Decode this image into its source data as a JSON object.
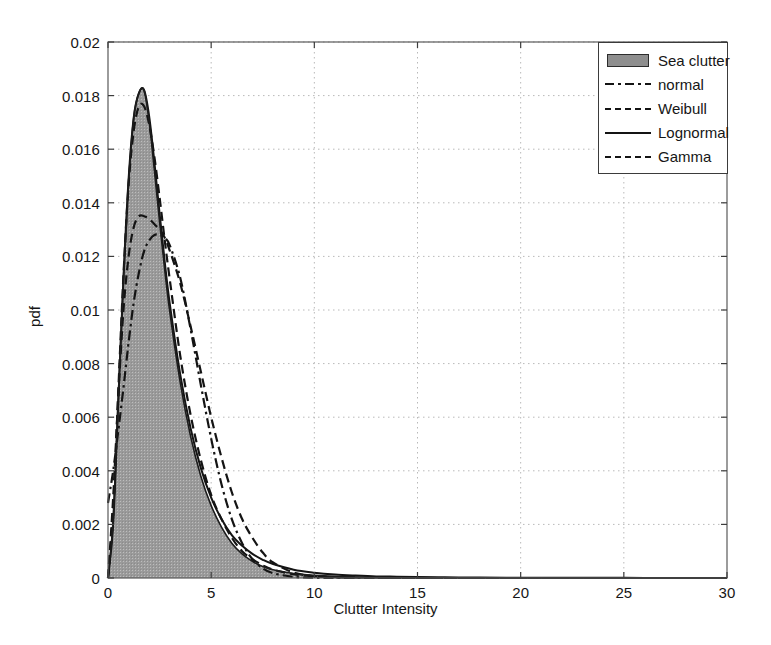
{
  "chart_data": {
    "type": "line",
    "title": "",
    "xlabel": "Clutter Intensity",
    "ylabel": "pdf",
    "xlim": [
      0,
      30
    ],
    "ylim": [
      0,
      0.02
    ],
    "xticks": [
      "0",
      "5",
      "10",
      "15",
      "20",
      "25",
      "30"
    ],
    "xtick_values": [
      0,
      5,
      10,
      15,
      20,
      25,
      30
    ],
    "yticks": [
      "0",
      "0.002",
      "0.004",
      "0.006",
      "0.008",
      "0.01",
      "0.012",
      "0.014",
      "0.016",
      "0.018",
      "0.02"
    ],
    "ytick_values": [
      0,
      0.002,
      0.004,
      0.006,
      0.008,
      0.01,
      0.012,
      0.014,
      0.016,
      0.018,
      0.02
    ],
    "grid": true,
    "legend_position": "top-right",
    "legend_entries": [
      {
        "label": "Sea clutter",
        "style": "patch",
        "color": "#8e8e8e"
      },
      {
        "label": "normal",
        "style": "dashdot",
        "color": "#141414"
      },
      {
        "label": "Weibull",
        "style": "dashed",
        "color": "#141414"
      },
      {
        "label": "Lognormal",
        "style": "solid",
        "color": "#141414"
      },
      {
        "label": "Gamma",
        "style": "dashed",
        "color": "#141414"
      }
    ],
    "x": [
      0,
      0.25,
      0.5,
      0.75,
      1,
      1.25,
      1.5,
      1.75,
      2,
      2.25,
      2.5,
      2.75,
      3,
      3.5,
      4,
      4.5,
      5,
      5.5,
      6,
      6.5,
      7,
      7.5,
      8,
      9,
      10,
      11,
      12,
      13,
      14,
      15,
      16,
      17,
      18,
      20,
      22,
      24,
      26,
      28,
      30
    ],
    "series": [
      {
        "name": "Sea clutter",
        "style": "filled-area",
        "values": [
          0.0,
          0.0022,
          0.0068,
          0.0112,
          0.0148,
          0.0172,
          0.0181,
          0.0182,
          0.017,
          0.0152,
          0.0133,
          0.0115,
          0.0099,
          0.0073,
          0.0053,
          0.0038,
          0.0027,
          0.0019,
          0.0013,
          0.0009,
          0.00062,
          0.00043,
          0.00031,
          0.00017,
          0.0001,
          6e-05,
          4e-05,
          3e-05,
          2e-05,
          2e-05,
          1e-05,
          1e-05,
          1e-05,
          1e-05,
          0.0,
          0.0,
          0.0,
          0.0,
          0.0
        ]
      },
      {
        "name": "normal",
        "style": "dashdot",
        "values": [
          0.0028,
          0.004,
          0.0055,
          0.0071,
          0.0088,
          0.0103,
          0.0114,
          0.0122,
          0.0126,
          0.0128,
          0.0128,
          0.0127,
          0.0124,
          0.0112,
          0.0093,
          0.0072,
          0.0052,
          0.0035,
          0.0022,
          0.0013,
          0.0007,
          0.00036,
          0.00018,
          4e-05,
          1e-05,
          0.0,
          0.0,
          0.0,
          0.0,
          0.0,
          0.0,
          0.0,
          0.0,
          0.0,
          0.0,
          0.0,
          0.0,
          0.0,
          0.0
        ]
      },
      {
        "name": "Weibull",
        "style": "dashed",
        "values": [
          0.0,
          0.003,
          0.0068,
          0.01,
          0.012,
          0.0131,
          0.0135,
          0.0135,
          0.0134,
          0.0132,
          0.013,
          0.0127,
          0.0122,
          0.011,
          0.0094,
          0.0077,
          0.006,
          0.0045,
          0.0032,
          0.0022,
          0.0015,
          0.00095,
          0.00058,
          0.0002,
          7e-05,
          2e-05,
          1e-05,
          0.0,
          0.0,
          0.0,
          0.0,
          0.0,
          0.0,
          0.0,
          0.0,
          0.0,
          0.0,
          0.0,
          0.0
        ]
      },
      {
        "name": "Lognormal",
        "style": "solid",
        "values": [
          0.0,
          0.002,
          0.0066,
          0.0112,
          0.0149,
          0.0172,
          0.0181,
          0.0182,
          0.0172,
          0.0155,
          0.0136,
          0.0118,
          0.0102,
          0.0076,
          0.0056,
          0.0041,
          0.003,
          0.0022,
          0.0016,
          0.0012,
          0.0009,
          0.00068,
          0.00052,
          0.00031,
          0.0002,
          0.00013,
          9e-05,
          6e-05,
          5e-05,
          4e-05,
          3e-05,
          2e-05,
          2e-05,
          1e-05,
          1e-05,
          1e-05,
          0.0,
          0.0,
          0.0
        ]
      },
      {
        "name": "Gamma",
        "style": "dashed",
        "values": [
          0.0,
          0.0024,
          0.007,
          0.0113,
          0.0147,
          0.0167,
          0.0176,
          0.0176,
          0.0169,
          0.0157,
          0.0142,
          0.0126,
          0.0111,
          0.0083,
          0.0061,
          0.0044,
          0.0031,
          0.0022,
          0.0015,
          0.001,
          0.0007,
          0.00047,
          0.00031,
          0.00014,
          6e-05,
          3e-05,
          1e-05,
          1e-05,
          0.0,
          0.0,
          0.0,
          0.0,
          0.0,
          0.0,
          0.0,
          0.0,
          0.0,
          0.0,
          0.0
        ]
      }
    ]
  }
}
